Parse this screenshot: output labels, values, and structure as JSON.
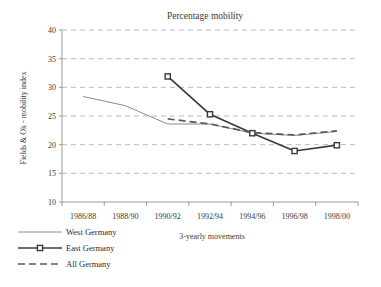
{
  "chart_data": {
    "type": "line",
    "title": "Percentage mobility",
    "xlabel": "3-yearly movements",
    "ylabel": "Fields & Ok - mobility index",
    "categories": [
      "1986/88",
      "1988/90",
      "1990/92",
      "1992/94",
      "1994/96",
      "1996/98",
      "1998/00"
    ],
    "ylim": [
      10,
      40
    ],
    "yticks": [
      10,
      15,
      20,
      25,
      30,
      35,
      40
    ],
    "ytick_labels": [
      "10",
      "15",
      "20",
      "25",
      "30",
      "35",
      "40"
    ],
    "grid": "horizontal-dashed",
    "legend_position": "bottom-left",
    "series": [
      {
        "name": "West Germany",
        "style": "thin-solid",
        "color": "#8a8a8a",
        "marker": "none",
        "values": [
          28.4,
          26.8,
          23.6,
          23.6,
          22.0,
          21.6,
          22.3
        ]
      },
      {
        "name": "East Germany",
        "style": "thick-solid",
        "color": "#3a3a3a",
        "marker": "open-square",
        "values": [
          null,
          null,
          31.9,
          25.3,
          22.0,
          18.9,
          19.9
        ]
      },
      {
        "name": "All Germany",
        "style": "thick-dashed",
        "color": "#5a5a5a",
        "marker": "none",
        "values": [
          null,
          null,
          24.5,
          23.6,
          22.1,
          21.7,
          22.4
        ]
      }
    ]
  },
  "legend": {
    "items": [
      {
        "label": "West Germany"
      },
      {
        "label": "East Germany"
      },
      {
        "label": "All Germany"
      }
    ]
  }
}
